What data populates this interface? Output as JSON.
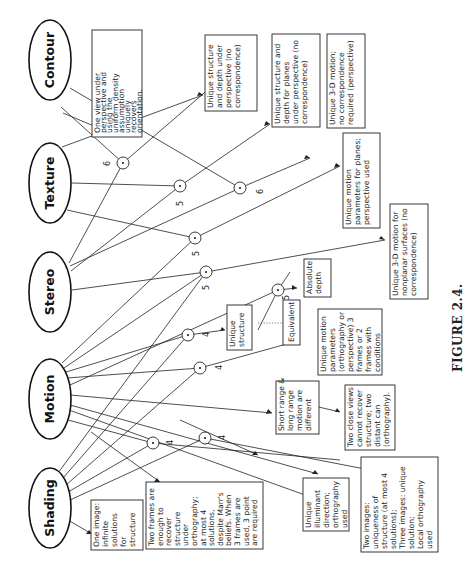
{
  "figure": {
    "caption": "FIGURE 2.4.",
    "orientation": "rotated 90° counter-clockwise",
    "modules": [
      {
        "id": "contour",
        "label": "Contour"
      },
      {
        "id": "texture",
        "label": "Texture"
      },
      {
        "id": "stereo",
        "label": "Stereo"
      },
      {
        "id": "motion",
        "label": "Motion"
      },
      {
        "id": "shading",
        "label": "Shading"
      }
    ],
    "boxes": [
      {
        "id": "contour_result",
        "lines": [
          "One view under",
          "perspective and",
          "using the",
          "uniform density",
          "assumption",
          "uniquely",
          "recovers",
          "orientation."
        ]
      },
      {
        "id": "texture_result",
        "lines": [
          "Unique structure",
          "and depth under",
          "perspective (no",
          "correspondence)"
        ]
      },
      {
        "id": "texture_planes",
        "lines": [
          "Unique structure and",
          "depth for planes",
          "under perspective (no",
          "correspondence)"
        ]
      },
      {
        "id": "motion_3d",
        "lines": [
          "Unique 3-D motion;",
          "no correspondence",
          "required (perspective)"
        ]
      },
      {
        "id": "motion_planes",
        "lines": [
          "Unique motion",
          "parameters for planes;",
          "perspective used"
        ]
      },
      {
        "id": "nonplanar",
        "lines": [
          "Unique 3-D motion for",
          "nonplanar surfaces (no",
          "correspondence)"
        ]
      },
      {
        "id": "absolute_depth",
        "lines": [
          "Absolute",
          "depth"
        ]
      },
      {
        "id": "unique_structure",
        "lines": [
          "Unique",
          "structure"
        ]
      },
      {
        "id": "equivalent",
        "lines": [
          "Equivalent"
        ]
      },
      {
        "id": "motion_params",
        "lines": [
          "Unique motion",
          "parameters",
          "(orthography or",
          "perspective) 3",
          "frames or 2",
          "frames with",
          "conditions"
        ]
      },
      {
        "id": "short_long",
        "lines": [
          "Short range &",
          "long range",
          "motion are",
          "different"
        ]
      },
      {
        "id": "two_close",
        "lines": [
          "Two close views",
          "cannot recover",
          "structure; two",
          "distant can",
          "(orthography)."
        ]
      },
      {
        "id": "shading_one",
        "lines": [
          "One image:",
          "infinite",
          "solutions",
          "for",
          "structure"
        ]
      },
      {
        "id": "two_frames",
        "lines": [
          "Two frames are",
          "enough to",
          "recover",
          "structure",
          "under",
          "orthography;",
          "at most 4",
          "solutions,",
          "despite Marr's",
          "beliefs. When",
          "3 frames are",
          "used, 3 point",
          "are required"
        ]
      },
      {
        "id": "illuminant",
        "lines": [
          "Unique",
          "illuminant",
          "direction;",
          "orthography",
          "used"
        ]
      },
      {
        "id": "two_images",
        "lines": [
          "Two images:",
          "uniqueness of",
          "structure (at most 4",
          "solutions);",
          "Three images: unique",
          "solution;",
          "Local orthography",
          "used"
        ]
      }
    ],
    "edge_numbers": [
      "3",
      "6",
      "6",
      "5",
      "5",
      "5",
      "5",
      "4",
      "4",
      "4",
      "4"
    ]
  }
}
